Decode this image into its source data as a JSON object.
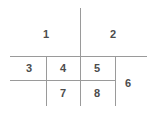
{
  "diagram": {
    "title": "",
    "background_color": "#ffffff",
    "line_color": "#9a9a9a",
    "label_color": "#4c4c4c",
    "width": 150,
    "height": 122,
    "labels": [
      {
        "text": "1",
        "x": 46,
        "y": 34
      },
      {
        "text": "2",
        "x": 113,
        "y": 34
      },
      {
        "text": "3",
        "x": 29,
        "y": 68
      },
      {
        "text": "4",
        "x": 63,
        "y": 68
      },
      {
        "text": "5",
        "x": 97,
        "y": 68
      },
      {
        "text": "6",
        "x": 128,
        "y": 83
      },
      {
        "text": "7",
        "x": 63,
        "y": 93
      },
      {
        "text": "8",
        "x": 97,
        "y": 93
      }
    ],
    "lines": [
      {
        "name": "vertical-center-line",
        "x1": 80,
        "y1": 8,
        "x2": 80,
        "y2": 106
      },
      {
        "name": "horizontal-upper-line",
        "x1": 10,
        "y1": 56,
        "x2": 147,
        "y2": 56
      },
      {
        "name": "horizontal-lower-line",
        "x1": 10,
        "y1": 80,
        "x2": 115,
        "y2": 80
      },
      {
        "name": "vertical-left-line",
        "x1": 46,
        "y1": 56,
        "x2": 46,
        "y2": 106
      },
      {
        "name": "vertical-right-line",
        "x1": 115,
        "y1": 56,
        "x2": 115,
        "y2": 106
      }
    ]
  }
}
